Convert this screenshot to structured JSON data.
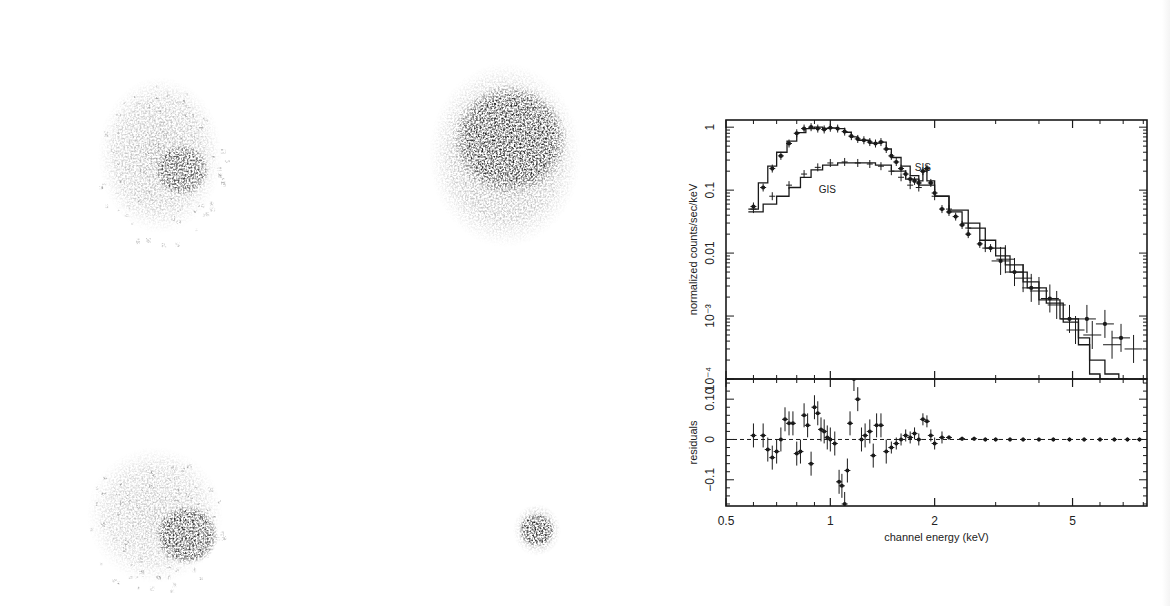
{
  "figure": {
    "images": [
      {
        "id": "top-left",
        "label": "xray-image-top-left",
        "cx": 160,
        "cy": 155,
        "rx": 62,
        "ry": 78,
        "core": {
          "cx": 182,
          "cy": 170,
          "r": 26,
          "opacity": 0.75
        },
        "halo_opacity": 0.42,
        "scatter": true
      },
      {
        "id": "top-right",
        "label": "xray-image-top-right",
        "cx": 505,
        "cy": 155,
        "rx": 76,
        "ry": 92,
        "core": {
          "cx": 510,
          "cy": 140,
          "r": 55,
          "opacity": 0.95
        },
        "halo_opacity": 0.5,
        "scatter": false
      },
      {
        "id": "bottom-left",
        "label": "xray-image-bottom-left",
        "cx": 155,
        "cy": 515,
        "rx": 68,
        "ry": 68,
        "core": {
          "cx": 187,
          "cy": 535,
          "r": 30,
          "opacity": 0.9
        },
        "halo_opacity": 0.35,
        "scatter": true
      },
      {
        "id": "bottom-right",
        "label": "xray-image-bottom-right",
        "cx": 537,
        "cy": 530,
        "rx": 24,
        "ry": 26,
        "core": {
          "cx": 537,
          "cy": 530,
          "r": 17,
          "opacity": 0.95
        },
        "halo_opacity": 0.4,
        "scatter": false
      }
    ]
  },
  "chart_data": {
    "type": "line",
    "title": "",
    "xlabel": "channel energy (keV)",
    "ylabel_top": "normalized counts/sec/keV",
    "ylabel_bottom": "residuals",
    "xscale": "log",
    "xlim": [
      0.5,
      8.2
    ],
    "xticks": [
      {
        "v": 0.5,
        "label": "0.5"
      },
      {
        "v": 1,
        "label": "1"
      },
      {
        "v": 2,
        "label": "2"
      },
      {
        "v": 5,
        "label": "5"
      }
    ],
    "top_panel": {
      "yscale": "log",
      "ylim": [
        0.0001,
        1.3
      ],
      "yticks": [
        {
          "v": 1,
          "label": "1"
        },
        {
          "v": 0.1,
          "label": "0.1"
        },
        {
          "v": 0.01,
          "label": "0.01"
        },
        {
          "v": 0.001,
          "label": "10⁻³"
        },
        {
          "v": 0.0001,
          "label": "10⁻⁴"
        }
      ],
      "annotations": [
        {
          "text": "SIS",
          "x": 1.85,
          "y": 0.2
        },
        {
          "text": "GIS",
          "x": 0.98,
          "y": 0.09
        }
      ],
      "series": [
        {
          "name": "SIS data",
          "marker": "filled",
          "x": [
            0.6,
            0.64,
            0.68,
            0.72,
            0.76,
            0.8,
            0.84,
            0.88,
            0.92,
            0.96,
            1.0,
            1.05,
            1.1,
            1.15,
            1.2,
            1.25,
            1.3,
            1.35,
            1.4,
            1.45,
            1.5,
            1.55,
            1.6,
            1.65,
            1.7,
            1.75,
            1.8,
            1.85,
            1.9,
            1.95,
            2.0,
            2.1,
            2.2,
            2.3,
            2.4,
            2.5,
            2.7,
            2.9,
            3.1,
            3.4,
            3.8,
            4.3,
            4.9,
            5.5,
            6.2,
            6.9
          ],
          "y": [
            0.055,
            0.11,
            0.22,
            0.35,
            0.55,
            0.8,
            0.95,
            1.0,
            0.95,
            0.92,
            0.98,
            0.95,
            0.85,
            0.72,
            0.65,
            0.62,
            0.58,
            0.55,
            0.58,
            0.45,
            0.35,
            0.28,
            0.22,
            0.18,
            0.15,
            0.14,
            0.13,
            0.2,
            0.22,
            0.13,
            0.09,
            0.05,
            0.045,
            0.038,
            0.028,
            0.02,
            0.014,
            0.012,
            0.0075,
            0.005,
            0.0028,
            0.0019,
            0.0009,
            0.0009,
            0.00075,
            0.00045
          ],
          "yerr_low": 0.08
        },
        {
          "name": "GIS data",
          "marker": "cross",
          "x": [
            0.6,
            0.68,
            0.76,
            0.84,
            0.92,
            1.0,
            1.1,
            1.2,
            1.3,
            1.4,
            1.5,
            1.6,
            1.7,
            1.8,
            2.0,
            2.2,
            2.5,
            2.8,
            3.2,
            3.6,
            4.0,
            4.5,
            5.1,
            5.7,
            6.5,
            7.5
          ],
          "y": [
            0.05,
            0.08,
            0.12,
            0.18,
            0.23,
            0.27,
            0.28,
            0.27,
            0.26,
            0.24,
            0.2,
            0.16,
            0.12,
            0.11,
            0.08,
            0.05,
            0.025,
            0.012,
            0.008,
            0.004,
            0.0025,
            0.0015,
            0.0006,
            0.0005,
            0.00035,
            0.0003
          ]
        },
        {
          "name": "SIS model",
          "style": "step",
          "x": [
            0.58,
            0.62,
            0.66,
            0.7,
            0.75,
            0.8,
            0.85,
            0.9,
            0.95,
            1.0,
            1.05,
            1.1,
            1.15,
            1.2,
            1.3,
            1.4,
            1.45,
            1.5,
            1.6,
            1.7,
            1.8,
            1.85,
            1.9,
            2.0,
            2.2,
            2.4,
            2.7,
            3.0,
            3.3,
            3.7,
            4.2,
            4.7,
            5.2,
            5.6,
            6.0
          ],
          "y": [
            0.05,
            0.13,
            0.24,
            0.4,
            0.6,
            0.82,
            0.95,
            1.0,
            0.96,
            0.97,
            0.95,
            0.83,
            0.7,
            0.62,
            0.56,
            0.58,
            0.45,
            0.33,
            0.24,
            0.17,
            0.14,
            0.2,
            0.14,
            0.08,
            0.045,
            0.03,
            0.016,
            0.009,
            0.005,
            0.0028,
            0.0016,
            0.0008,
            0.00035,
            0.00012,
            0.0001
          ]
        },
        {
          "name": "GIS model",
          "style": "step",
          "x": [
            0.58,
            0.64,
            0.7,
            0.76,
            0.82,
            0.88,
            0.95,
            1.05,
            1.2,
            1.35,
            1.5,
            1.65,
            1.8,
            2.0,
            2.2,
            2.5,
            2.8,
            3.2,
            3.6,
            4.0,
            4.6,
            5.2,
            5.6,
            6.2,
            6.8
          ],
          "y": [
            0.045,
            0.06,
            0.08,
            0.11,
            0.16,
            0.21,
            0.25,
            0.27,
            0.27,
            0.25,
            0.2,
            0.15,
            0.12,
            0.08,
            0.048,
            0.025,
            0.012,
            0.0065,
            0.0035,
            0.0018,
            0.0009,
            0.00045,
            0.0002,
            0.00012,
            0.0001
          ]
        }
      ]
    },
    "bottom_panel": {
      "yscale": "linear",
      "ylim": [
        -0.165,
        0.15
      ],
      "yticks": [
        {
          "v": 0.1,
          "label": "0.10"
        },
        {
          "v": 0,
          "label": "0"
        },
        {
          "v": -0.1,
          "label": "−0.1"
        }
      ],
      "zero_line": "dashed",
      "series": [
        {
          "name": "residuals",
          "x": [
            0.6,
            0.64,
            0.66,
            0.68,
            0.7,
            0.72,
            0.74,
            0.76,
            0.78,
            0.8,
            0.82,
            0.84,
            0.86,
            0.88,
            0.9,
            0.92,
            0.94,
            0.96,
            0.98,
            1.0,
            1.03,
            1.06,
            1.08,
            1.1,
            1.12,
            1.14,
            1.17,
            1.2,
            1.23,
            1.26,
            1.3,
            1.33,
            1.36,
            1.4,
            1.45,
            1.5,
            1.55,
            1.6,
            1.65,
            1.7,
            1.75,
            1.8,
            1.85,
            1.9,
            1.95,
            2.0,
            2.1,
            2.2,
            2.4,
            2.6,
            2.8,
            3.0,
            3.3,
            3.6,
            4.0,
            4.4,
            4.9,
            5.4,
            6.0,
            6.6,
            7.2,
            7.8
          ],
          "y": [
            0.01,
            0.01,
            -0.025,
            -0.045,
            -0.03,
            0.0,
            0.05,
            0.04,
            0.04,
            -0.035,
            -0.03,
            0.06,
            0.035,
            -0.06,
            0.08,
            0.065,
            0.025,
            0.02,
            0.005,
            0.0,
            -0.01,
            -0.105,
            -0.115,
            -0.16,
            -0.077,
            0.04,
            0.15,
            0.1,
            0.0,
            0.01,
            0.02,
            -0.04,
            0.035,
            0.035,
            -0.03,
            -0.02,
            -0.01,
            0.0,
            0.01,
            0.005,
            0.015,
            0.0,
            0.05,
            0.045,
            0.01,
            -0.01,
            0.005,
            0.005,
            0.002,
            0.002,
            0.0,
            0.0,
            0.0,
            0.0,
            0.0,
            0.0,
            0.0,
            0.0,
            0.0,
            0.0,
            0.0,
            0.0
          ]
        }
      ]
    },
    "legend": "inline annotations (SIS, GIS)",
    "grid": false
  }
}
